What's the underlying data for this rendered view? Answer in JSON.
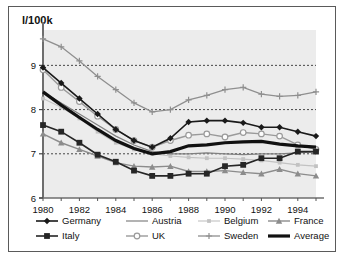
{
  "chart_data": {
    "type": "line",
    "title": "",
    "ylabel": "l/100k",
    "xlabel": "",
    "ylim": [
      6,
      9.8
    ],
    "xlim": [
      1980,
      1995
    ],
    "yticks": [
      6,
      7,
      8,
      9
    ],
    "ytick_labels": [
      "6",
      "7",
      "8",
      "9"
    ],
    "xticks": [
      1980,
      1982,
      1984,
      1986,
      1988,
      1990,
      1992,
      1994
    ],
    "xtick_labels": [
      "1980",
      "1982",
      "1984",
      "1986",
      "1988",
      "1990",
      "1992",
      "1994"
    ],
    "grid": "horizontal-dashed",
    "legend_position": "below",
    "x": [
      1980,
      1981,
      1982,
      1983,
      1984,
      1985,
      1986,
      1987,
      1988,
      1989,
      1990,
      1991,
      1992,
      1993,
      1994,
      1995
    ],
    "series": [
      {
        "name": "Germany",
        "color": "#1a1a1a",
        "marker": "diamond",
        "width": 1.6,
        "values": [
          8.95,
          8.6,
          8.25,
          7.9,
          7.55,
          7.3,
          7.15,
          7.35,
          7.72,
          7.75,
          7.75,
          7.7,
          7.6,
          7.6,
          7.5,
          7.4
        ]
      },
      {
        "name": "Austria",
        "color": "#808080",
        "marker": "none",
        "width": 1.2,
        "values": [
          8.4,
          8.15,
          7.9,
          7.65,
          7.4,
          7.2,
          7.05,
          7.0,
          7.0,
          7.02,
          7.0,
          6.98,
          7.0,
          7.0,
          7.02,
          7.05
        ]
      },
      {
        "name": "Belgium",
        "color": "#c2c2c2",
        "marker": "small-square",
        "width": 1.1,
        "values": [
          8.25,
          8.05,
          7.8,
          7.5,
          7.25,
          7.1,
          7.0,
          6.95,
          6.92,
          6.9,
          6.9,
          6.88,
          6.85,
          6.8,
          6.75,
          6.72
        ]
      },
      {
        "name": "France",
        "color": "#8c8c8c",
        "marker": "triangle",
        "width": 1.4,
        "values": [
          7.45,
          7.25,
          7.1,
          6.95,
          6.8,
          6.72,
          6.7,
          6.72,
          6.6,
          6.6,
          6.62,
          6.58,
          6.55,
          6.65,
          6.55,
          6.5
        ]
      },
      {
        "name": "Italy",
        "color": "#262626",
        "marker": "square",
        "width": 1.6,
        "values": [
          7.65,
          7.5,
          7.25,
          6.98,
          6.82,
          6.62,
          6.5,
          6.5,
          6.55,
          6.55,
          6.72,
          6.75,
          6.9,
          6.9,
          7.05,
          7.05
        ]
      },
      {
        "name": "UK",
        "color": "#9a9a9a",
        "marker": "circle",
        "width": 1.4,
        "values": [
          8.9,
          8.5,
          8.18,
          7.85,
          7.55,
          7.3,
          7.15,
          7.3,
          7.42,
          7.45,
          7.38,
          7.48,
          7.45,
          7.4,
          7.2,
          7.1
        ]
      },
      {
        "name": "Sweden",
        "color": "#8f8f8f",
        "marker": "plus",
        "width": 1.3,
        "values": [
          9.6,
          9.42,
          9.1,
          8.75,
          8.45,
          8.15,
          7.95,
          8.0,
          8.22,
          8.32,
          8.45,
          8.5,
          8.35,
          8.3,
          8.32,
          8.4
        ]
      },
      {
        "name": "Average",
        "color": "#111111",
        "marker": "none",
        "width": 3.2,
        "values": [
          8.4,
          8.1,
          7.82,
          7.55,
          7.3,
          7.12,
          7.0,
          7.05,
          7.18,
          7.2,
          7.25,
          7.27,
          7.28,
          7.22,
          7.18,
          7.15
        ]
      }
    ]
  },
  "legend": {
    "items": [
      {
        "label": "Germany"
      },
      {
        "label": "Austria"
      },
      {
        "label": "Belgium"
      },
      {
        "label": "France"
      },
      {
        "label": "Italy"
      },
      {
        "label": "UK"
      },
      {
        "label": "Sweden"
      },
      {
        "label": "Average"
      }
    ]
  }
}
